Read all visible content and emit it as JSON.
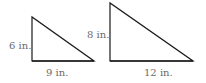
{
  "triangles": [
    {
      "name": "small-triangle",
      "height_label": "6 in.",
      "base_label": "9 in."
    },
    {
      "name": "large-triangle",
      "height_label": "8 in.",
      "base_label": "12 in."
    }
  ],
  "colors": {
    "stroke": "#1a1a1a",
    "label": "#6b6b6b",
    "background": "#ffffff"
  }
}
